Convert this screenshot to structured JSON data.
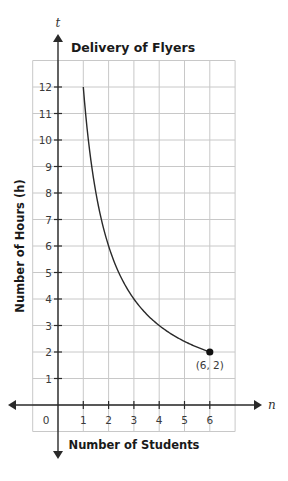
{
  "chart_data": {
    "type": "line",
    "title": "Delivery of Flyers",
    "xlabel": "Number of Students",
    "ylabel": "Number of Hours (h)",
    "x_axis_variable": "n",
    "y_axis_variable": "t",
    "xlim": [
      -1,
      7
    ],
    "ylim": [
      -1,
      13
    ],
    "x_ticks": [
      1,
      2,
      3,
      4,
      5,
      6
    ],
    "y_ticks": [
      1,
      2,
      3,
      4,
      5,
      6,
      7,
      8,
      9,
      10,
      11,
      12
    ],
    "origin_label": "0",
    "grid": true,
    "equation": "t = 12 / n",
    "series": [
      {
        "name": "Delivery time",
        "x": [
          1,
          1.5,
          2,
          2.5,
          3,
          3.5,
          4,
          4.5,
          5,
          5.5,
          6
        ],
        "values": [
          12,
          8,
          6,
          4.8,
          4,
          3.43,
          3,
          2.67,
          2.4,
          2.18,
          2
        ]
      }
    ],
    "annotations": [
      {
        "x": 6,
        "y": 2,
        "text": "(6, 2)",
        "marker": "filled-dot"
      }
    ]
  },
  "colors": {
    "grid": "#c8c8c8",
    "axis": "#2a2a2a",
    "curve": "#2a2a2a"
  }
}
